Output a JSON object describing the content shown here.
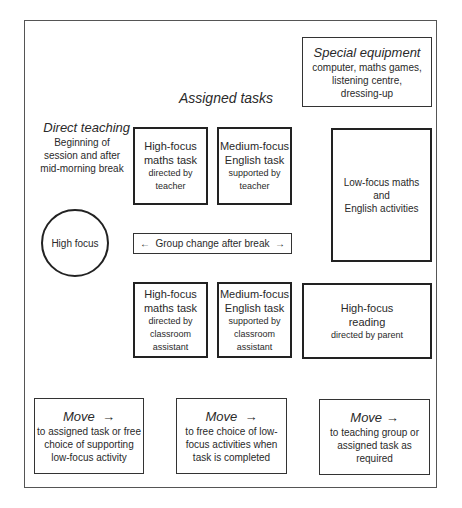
{
  "diagram": {
    "special_equipment": {
      "title": "Special equipment",
      "lines": [
        "computer, maths games,",
        "listening centre,",
        "dressing-up"
      ]
    },
    "assigned_tasks_heading": "Assigned tasks",
    "direct_teaching": {
      "title": "Direct teaching",
      "lines": [
        "Beginning of",
        "session and after",
        "mid-morning break"
      ]
    },
    "high_focus_circle": "High focus",
    "group_change": "←  Group change after break  →",
    "tasks_top": [
      {
        "line1": "High-focus",
        "line2": "maths task",
        "line3": "directed by",
        "line4": "teacher"
      },
      {
        "line1": "Medium-focus",
        "line2": "English task",
        "line3": "supported by",
        "line4": "teacher"
      }
    ],
    "tasks_bottom": [
      {
        "line1": "High-focus",
        "line2": "maths task",
        "line3": "directed by",
        "line4": "classroom",
        "line5": "assistant"
      },
      {
        "line1": "Medium-focus",
        "line2": "English task",
        "line3": "supported by",
        "line4": "classroom",
        "line5": "assistant"
      }
    ],
    "low_focus": {
      "lines": [
        "Low-focus maths",
        "and",
        "English activities"
      ]
    },
    "reading": {
      "line1": "High-focus",
      "line2": "reading",
      "line3": "directed by parent"
    },
    "moves": [
      {
        "title": "Move  →",
        "lines": [
          "to assigned task or free",
          "choice of supporting",
          "low-focus activity"
        ]
      },
      {
        "title": "Move  →",
        "lines": [
          "to free choice of low-",
          "focus activities when",
          "task is completed"
        ]
      },
      {
        "title": "Move →",
        "lines": [
          "to teaching group or",
          "assigned task as",
          "required"
        ]
      }
    ]
  }
}
